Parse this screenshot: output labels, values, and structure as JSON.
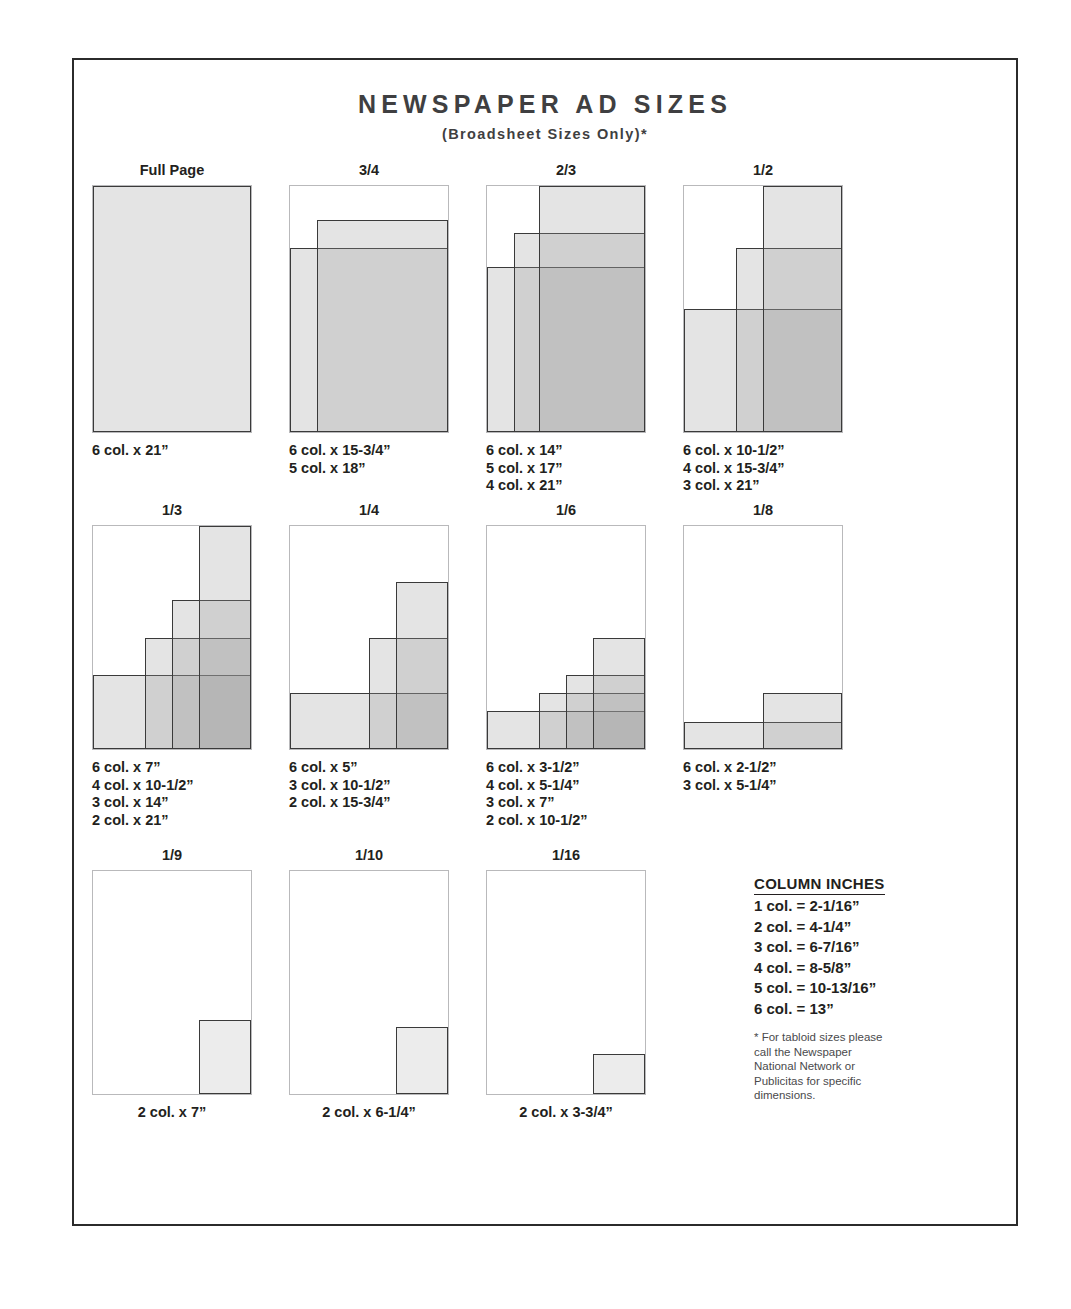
{
  "header": {
    "title": "NEWSPAPER AD SIZES",
    "subtitle": "(Broadsheet Sizes Only)*"
  },
  "credit": "Courtesy of Newspaper National Network.",
  "chart_data": {
    "type": "diagram",
    "title": "NEWSPAPER AD SIZES",
    "subtitle": "(Broadsheet Sizes Only)*",
    "note": "Each cell shows a full broadsheet page outline with one or more shaded rectangles representing the ad footprint; overlapping rectangles darken where they stack.",
    "cells": [
      {
        "label": "Full Page",
        "caption": "6 col. x 21”",
        "sizes": [
          "6 col. x 21”"
        ],
        "rects": [
          {
            "w": 100,
            "h": 100
          }
        ]
      },
      {
        "label": "3/4",
        "caption": "6 col. x 15-3/4”\n5 col. x 18”",
        "sizes": [
          "6 col. x 15-3/4”",
          "5 col. x 18”"
        ],
        "rects": [
          {
            "w": 100,
            "h": 75
          },
          {
            "w": 83,
            "h": 86
          }
        ]
      },
      {
        "label": "2/3",
        "caption": "6 col. x 14”\n5 col. x 17”\n4 col. x 21”",
        "sizes": [
          "6 col. x 14”",
          "5 col. x 17”",
          "4 col. x 21”"
        ],
        "rects": [
          {
            "w": 100,
            "h": 67
          },
          {
            "w": 83,
            "h": 81
          },
          {
            "w": 67,
            "h": 100
          }
        ]
      },
      {
        "label": "1/2",
        "caption": "6 col. x 10-1/2”\n4 col. x 15-3/4”\n3 col. x 21”",
        "sizes": [
          "6 col. x 10-1/2”",
          "4 col. x 15-3/4”",
          "3 col. x 21”"
        ],
        "rects": [
          {
            "w": 100,
            "h": 50
          },
          {
            "w": 67,
            "h": 75
          },
          {
            "w": 50,
            "h": 100
          }
        ]
      },
      {
        "label": "1/3",
        "caption": "6 col. x 7”\n4 col. x 10-1/2”\n3 col. x 14”\n2 col. x 21”",
        "sizes": [
          "6 col. x 7”",
          "4 col. x 10-1/2”",
          "3 col. x 14”",
          "2 col. x 21”"
        ],
        "rects": [
          {
            "w": 100,
            "h": 33
          },
          {
            "w": 67,
            "h": 50
          },
          {
            "w": 50,
            "h": 67
          },
          {
            "w": 33,
            "h": 100
          }
        ]
      },
      {
        "label": "1/4",
        "caption": "6 col. x 5”\n3 col. x 10-1/2”\n2 col. x 15-3/4”",
        "sizes": [
          "6 col. x 5”",
          "3 col. x 10-1/2”",
          "2 col. x 15-3/4”"
        ],
        "rects": [
          {
            "w": 100,
            "h": 25
          },
          {
            "w": 50,
            "h": 50
          },
          {
            "w": 33,
            "h": 75
          }
        ]
      },
      {
        "label": "1/6",
        "caption": "6 col. x 3-1/2”\n4 col. x 5-1/4”\n3 col. x 7”\n2 col. x 10-1/2”",
        "sizes": [
          "6 col. x 3-1/2”",
          "4 col. x 5-1/4”",
          "3 col. x 7”",
          "2 col. x 10-1/2”"
        ],
        "rects": [
          {
            "w": 100,
            "h": 17
          },
          {
            "w": 67,
            "h": 25
          },
          {
            "w": 50,
            "h": 33
          },
          {
            "w": 33,
            "h": 50
          }
        ]
      },
      {
        "label": "1/8",
        "caption": "6 col. x 2-1/2”\n3 col. x 5-1/4”",
        "sizes": [
          "6 col. x 2-1/2”",
          "3 col. x 5-1/4”"
        ],
        "rects": [
          {
            "w": 100,
            "h": 12
          },
          {
            "w": 50,
            "h": 25
          }
        ]
      },
      {
        "label": "1/9",
        "caption": "2 col. x 7”",
        "sizes": [
          "2 col. x 7”"
        ],
        "rects": [
          {
            "w": 33,
            "h": 33,
            "style": "plain"
          }
        ]
      },
      {
        "label": "1/10",
        "caption": "2 col. x 6-1/4”",
        "sizes": [
          "2 col. x 6-1/4”"
        ],
        "rects": [
          {
            "w": 33,
            "h": 30,
            "style": "plain"
          }
        ]
      },
      {
        "label": "1/16",
        "caption": "2 col. x 3-3/4”",
        "sizes": [
          "2 col. x 3-3/4”"
        ],
        "rects": [
          {
            "w": 33,
            "h": 18,
            "style": "plain"
          }
        ]
      }
    ]
  },
  "legend": {
    "title": "COLUMN INCHES",
    "lines": [
      "1 col. = 2-1/16”",
      "2 col. = 4-1/4”",
      "3 col. = 6-7/16”",
      "4 col. = 8-5/8”",
      "5 col. = 10-13/16”",
      "6 col. = 13”"
    ],
    "note": "* For tabloid sizes please\ncall the Newspaper\nNational Network or\nPublicitas for specific\ndimensions."
  }
}
